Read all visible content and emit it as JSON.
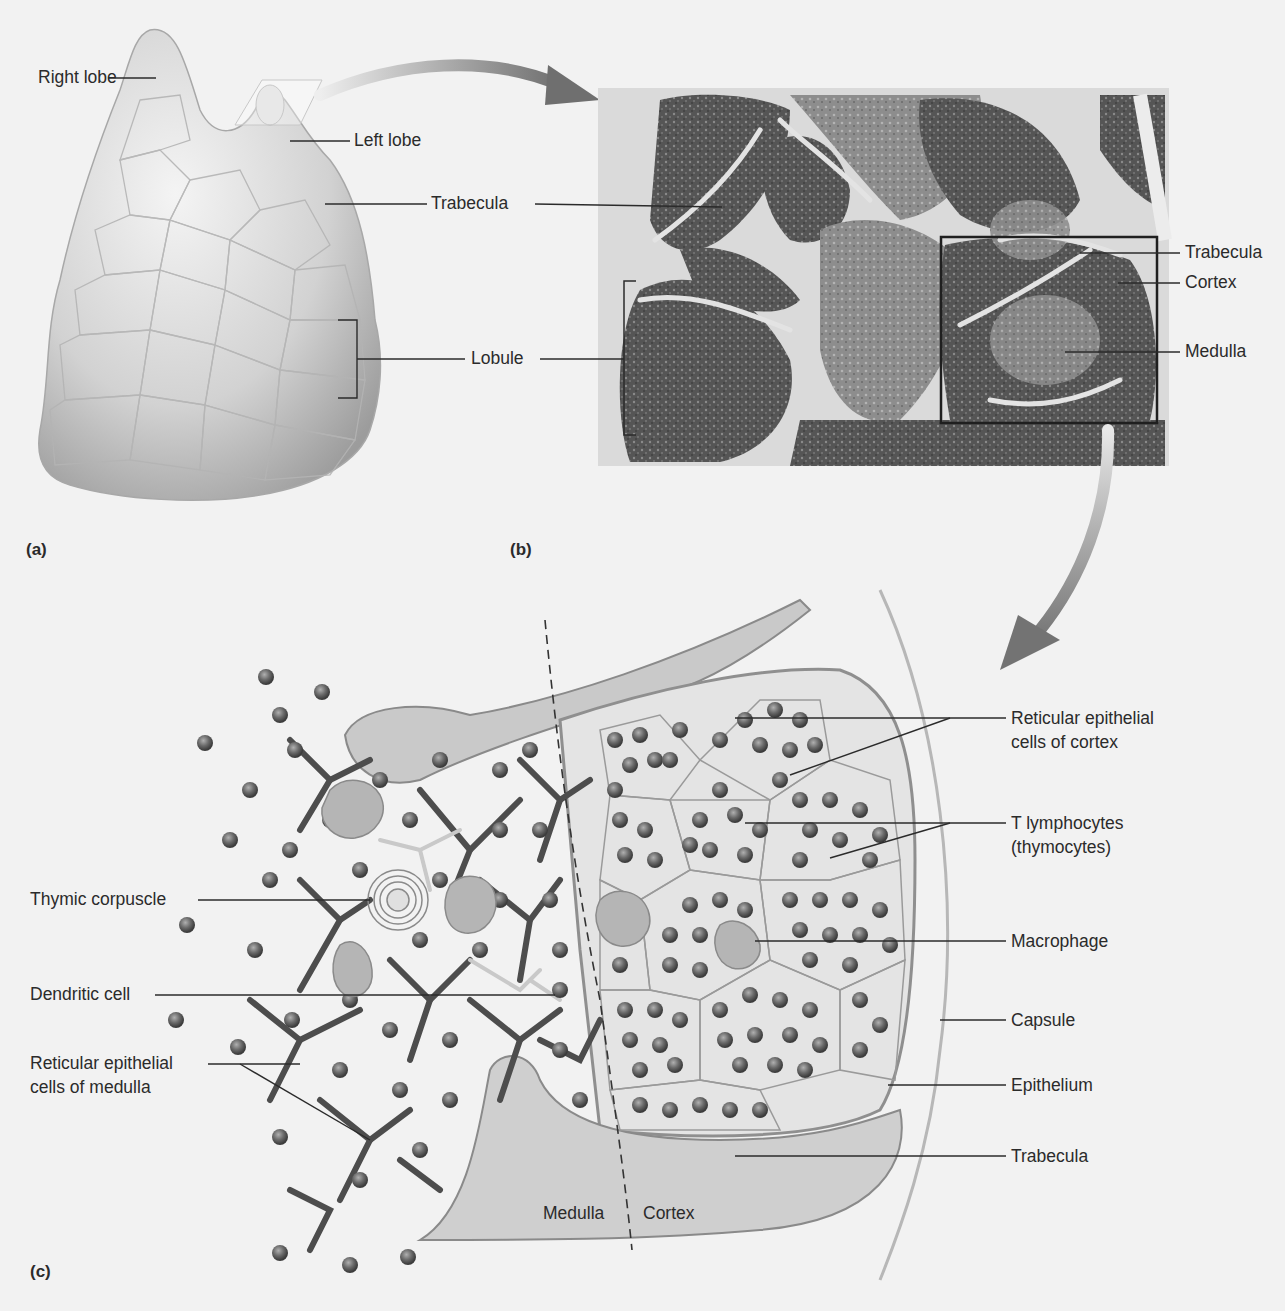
{
  "figure": {
    "panels": [
      {
        "id": "a",
        "label": "(a)"
      },
      {
        "id": "b",
        "label": "(b)"
      },
      {
        "id": "c",
        "label": "(c)"
      }
    ]
  },
  "panel_a": {
    "labels": {
      "right_lobe": "Right lobe",
      "left_lobe": "Left lobe",
      "trabecula": "Trabecula",
      "lobule": "Lobule"
    }
  },
  "panel_b": {
    "labels": {
      "trabecula": "Trabecula",
      "cortex": "Cortex",
      "medulla": "Medulla"
    }
  },
  "panel_c": {
    "labels_right": {
      "reticular_cortex_1": "Reticular epithelial",
      "reticular_cortex_2": "cells of cortex",
      "t_lymphocytes_1": "T lymphocytes",
      "t_lymphocytes_2": "(thymocytes)",
      "macrophage": "Macrophage",
      "capsule": "Capsule",
      "epithelium": "Epithelium",
      "trabecula": "Trabecula"
    },
    "labels_left": {
      "thymic_corpuscle": "Thymic corpuscle",
      "dendritic_cell": "Dendritic cell",
      "reticular_medulla_1": "Reticular epithelial",
      "reticular_medulla_2": "cells of medulla"
    },
    "region_labels": {
      "medulla": "Medulla",
      "cortex": "Cortex"
    }
  },
  "colors": {
    "background": "#f2f2f2",
    "tissue_light": "#d9d9d9",
    "tissue_mid": "#9a9a9a",
    "tissue_dark": "#4a4a4a",
    "leader_line": "#2b2b2b"
  }
}
